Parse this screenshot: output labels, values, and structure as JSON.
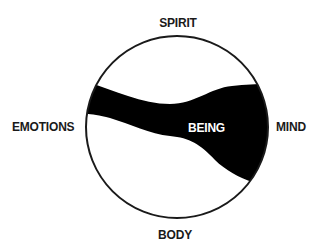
{
  "diagram": {
    "labels": {
      "top": "SPIRIT",
      "bottom": "BODY",
      "left": "EMOTIONS",
      "right": "MIND",
      "center": "BEING"
    },
    "colors": {
      "background": "#ffffff",
      "circle_stroke": "#1a1a1a",
      "band_fill": "#000000",
      "label_text": "#1a1a1a",
      "center_label_text": "#ffffff"
    }
  }
}
